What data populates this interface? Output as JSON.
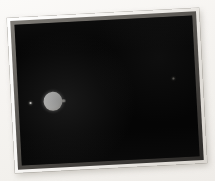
{
  "scene": {
    "kind": "photographic-print",
    "subject": "astronomical night-sky exposure",
    "background_color": "#f7f5f2",
    "print": {
      "border_color": "#ffffff",
      "bevel_color": "#4e4b47",
      "sky_color": "#050505",
      "rotation_deg": -3,
      "caption": ""
    },
    "objects": [
      {
        "id": "planet-disk",
        "label": "bright planetary disk",
        "color": "#ffffff",
        "diameter_px": 19,
        "center_x_px": 50,
        "center_y_px": 99,
        "brightness": "saturated"
      },
      {
        "id": "moon-dot",
        "label": "small companion moon",
        "color": "#f2f0ea",
        "diameter_px": 2,
        "center_x_px": 36,
        "center_y_px": 99,
        "brightness": "bright"
      },
      {
        "id": "faint-star",
        "label": "faint distant point source",
        "color": "#6a6862",
        "diameter_px": 2,
        "center_x_px": 172,
        "center_y_px": 84,
        "brightness": "faint"
      }
    ]
  }
}
